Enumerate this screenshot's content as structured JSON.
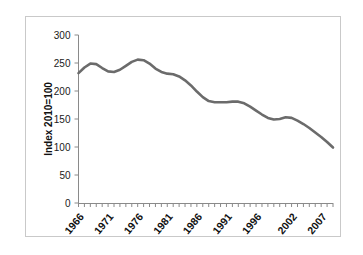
{
  "chart_data": {
    "type": "line",
    "title": "",
    "xlabel": "",
    "ylabel": "Index 2010=100",
    "ylim": [
      0,
      300
    ],
    "ytick_labels": [
      "0",
      "50",
      "100",
      "150",
      "200",
      "250",
      "300"
    ],
    "ytick_values": [
      0,
      50,
      100,
      150,
      200,
      250,
      300
    ],
    "xtick_labels": [
      "1966",
      "1971",
      "1976",
      "1981",
      "1986",
      "1991",
      "1996",
      "2002",
      "2007"
    ],
    "xtick_values": [
      1966,
      1971,
      1976,
      1981,
      1986,
      1991,
      1996,
      2002,
      2007
    ],
    "xlim": [
      1966,
      2009
    ],
    "grid": false,
    "legend": "none",
    "line_color": "#6b6b6b",
    "series": [
      {
        "name": "Index 2010=100",
        "x": [
          1966,
          1967,
          1968,
          1969,
          1970,
          1971,
          1972,
          1973,
          1974,
          1975,
          1976,
          1977,
          1978,
          1979,
          1980,
          1981,
          1982,
          1983,
          1984,
          1985,
          1986,
          1987,
          1988,
          1989,
          1990,
          1991,
          1992,
          1993,
          1994,
          1995,
          1996,
          1997,
          1998,
          1999,
          2000,
          2001,
          2002,
          2003,
          2004,
          2005,
          2006,
          2007,
          2008,
          2009
        ],
        "values": [
          232,
          242,
          249,
          248,
          241,
          235,
          234,
          238,
          245,
          252,
          256,
          255,
          249,
          240,
          234,
          231,
          230,
          226,
          219,
          210,
          199,
          189,
          182,
          180,
          180,
          180,
          181,
          181,
          178,
          172,
          165,
          158,
          152,
          149,
          150,
          153,
          152,
          147,
          141,
          134,
          126,
          118,
          109,
          99
        ]
      }
    ]
  },
  "axis": {
    "y_title": "Index 2010=100"
  }
}
